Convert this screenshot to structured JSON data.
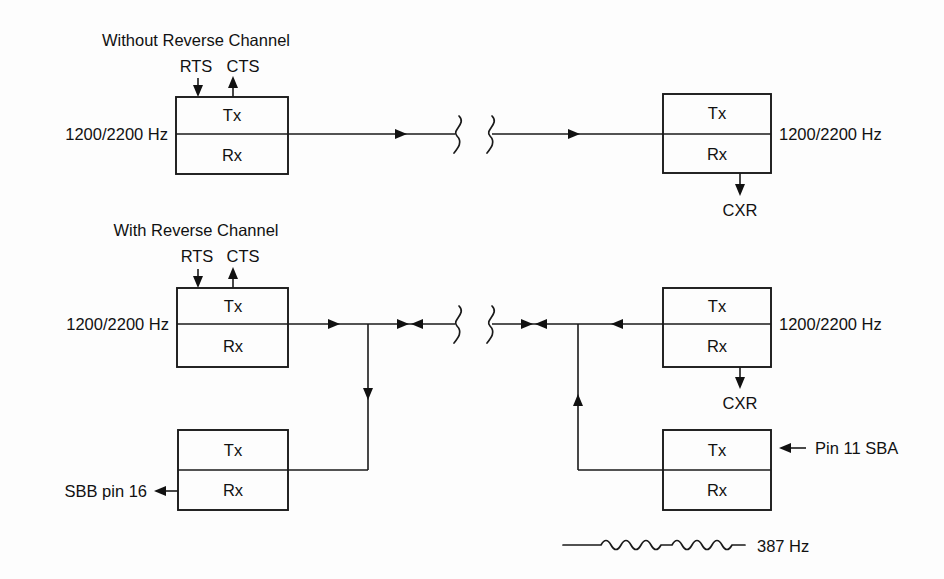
{
  "page": {
    "background_color": "#fdfdfd",
    "ink_color": "#111111",
    "width": 944,
    "height": 579
  },
  "diagram": {
    "type": "block-diagram",
    "sections": [
      {
        "id": "without-reverse-channel",
        "title": "Without Reverse Channel",
        "control_signals": [
          {
            "name": "RTS",
            "direction": "into-modem"
          },
          {
            "name": "CTS",
            "direction": "out-of-modem"
          }
        ],
        "left_modem": {
          "upper_label": "Tx",
          "lower_label": "Rx",
          "side_label": "1200/2200 Hz"
        },
        "right_modem": {
          "upper_label": "Tx",
          "lower_label": "Rx",
          "side_label": "1200/2200 Hz",
          "output_label": "CXR"
        },
        "link": {
          "break_symbol": "double-squiggle",
          "arrow_count": 2,
          "arrow_direction": "left-to-right"
        }
      },
      {
        "id": "with-reverse-channel",
        "title": "With Reverse Channel",
        "control_signals": [
          {
            "name": "RTS",
            "direction": "into-modem"
          },
          {
            "name": "CTS",
            "direction": "out-of-modem"
          }
        ],
        "left_modem": {
          "upper_label": "Tx",
          "lower_label": "Rx",
          "side_label": "1200/2200 Hz"
        },
        "right_modem": {
          "upper_label": "Tx",
          "lower_label": "Rx",
          "side_label": "1200/2200 Hz",
          "output_label": "CXR"
        },
        "left_reverse_modem": {
          "upper_label": "Tx",
          "lower_label": "Rx",
          "output_label": "SBB pin 16"
        },
        "right_reverse_modem": {
          "upper_label": "Tx",
          "lower_label": "Rx",
          "input_label": "Pin 11 SBA"
        },
        "link": {
          "break_symbol": "double-squiggle",
          "arrow_direction": "bidirectional"
        }
      }
    ],
    "legend": {
      "waveform_label": "387 Hz",
      "waveform_style": "sine-burst-on-line"
    }
  }
}
